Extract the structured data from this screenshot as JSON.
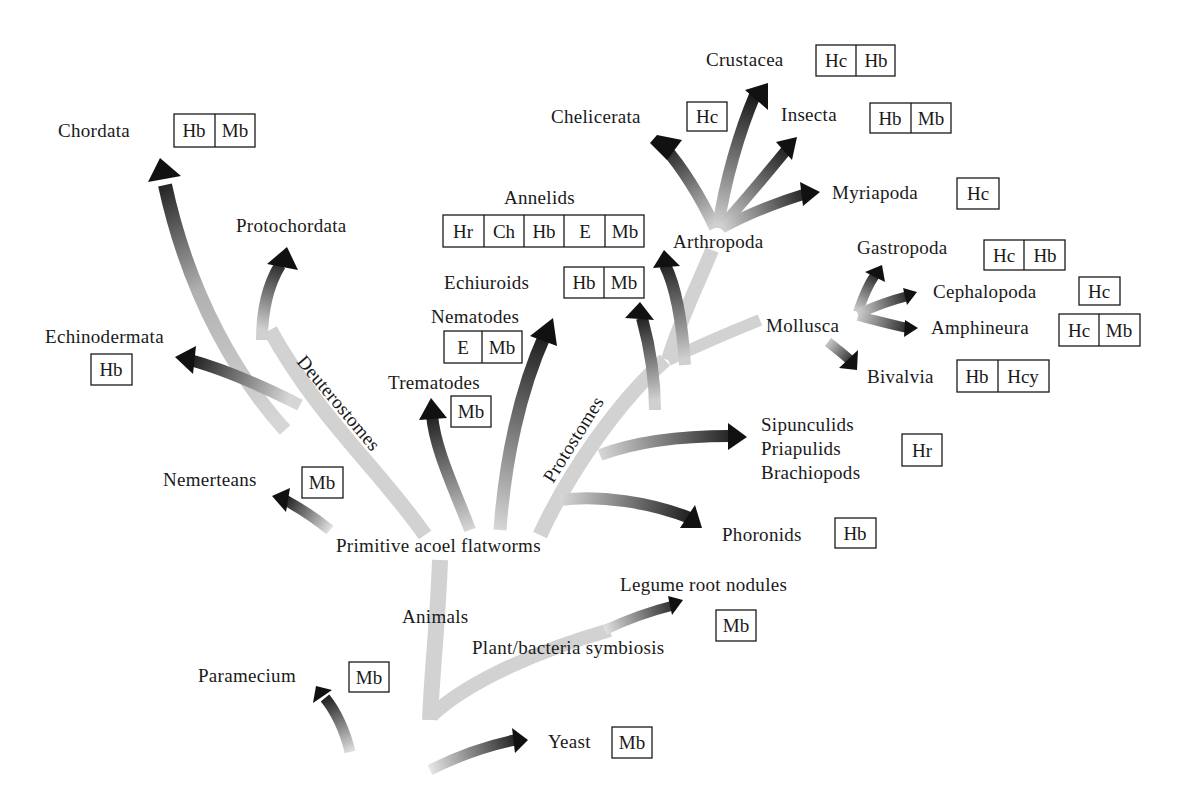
{
  "diagram": {
    "colors": {
      "trunk_light": "#d4d4d4",
      "arrow_dark": "#111111",
      "text": "#1a1a1a",
      "background": "#ffffff"
    },
    "branch_labels": {
      "deuterostomes": "Deuterostomes",
      "protostomes": "Protostomes",
      "animals": "Animals",
      "primitive": "Primitive acoel flatworms",
      "arthropoda": "Arthropoda",
      "mollusca": "Mollusca",
      "plant_bacteria": "Plant/bacteria symbiosis"
    },
    "taxa": {
      "chordata": {
        "label": "Chordata",
        "proteins": [
          "Hb",
          "Mb"
        ]
      },
      "protochordata": {
        "label": "Protochordata",
        "proteins": []
      },
      "echinodermata": {
        "label": "Echinodermata",
        "proteins": [
          "Hb"
        ]
      },
      "nemerteans": {
        "label": "Nemerteans",
        "proteins": [
          "Mb"
        ]
      },
      "trematodes": {
        "label": "Trematodes",
        "proteins": [
          "Mb"
        ]
      },
      "nematodes": {
        "label": "Nematodes",
        "proteins": [
          "E",
          "Mb"
        ]
      },
      "annelids": {
        "label": "Annelids",
        "proteins": [
          "Hr",
          "Ch",
          "Hb",
          "E",
          "Mb"
        ]
      },
      "echiuroids": {
        "label": "Echiuroids",
        "proteins": [
          "Hb",
          "Mb"
        ]
      },
      "chelicerata": {
        "label": "Chelicerata",
        "proteins": [
          "Hc"
        ]
      },
      "crustacea": {
        "label": "Crustacea",
        "proteins": [
          "Hc",
          "Hb"
        ]
      },
      "insecta": {
        "label": "Insecta",
        "proteins": [
          "Hb",
          "Mb"
        ]
      },
      "myriapoda": {
        "label": "Myriapoda",
        "proteins": [
          "Hc"
        ]
      },
      "gastropoda": {
        "label": "Gastropoda",
        "proteins": [
          "Hc",
          "Hb"
        ]
      },
      "cephalopoda": {
        "label": "Cephalopoda",
        "proteins": [
          "Hc"
        ]
      },
      "amphineura": {
        "label": "Amphineura",
        "proteins": [
          "Hc",
          "Mb"
        ]
      },
      "bivalvia": {
        "label": "Bivalvia",
        "proteins": [
          "Hb",
          "Hcy"
        ]
      },
      "sipunculids_group": {
        "label_lines": [
          "Sipunculids",
          "Priapulids",
          "Brachiopods"
        ],
        "proteins": [
          "Hr"
        ]
      },
      "phoronids": {
        "label": "Phoronids",
        "proteins": [
          "Hb"
        ]
      },
      "legume": {
        "label": "Legume root nodules",
        "proteins": [
          "Mb"
        ]
      },
      "paramecium": {
        "label": "Paramecium",
        "proteins": [
          "Mb"
        ]
      },
      "yeast": {
        "label": "Yeast",
        "proteins": [
          "Mb"
        ]
      }
    }
  }
}
